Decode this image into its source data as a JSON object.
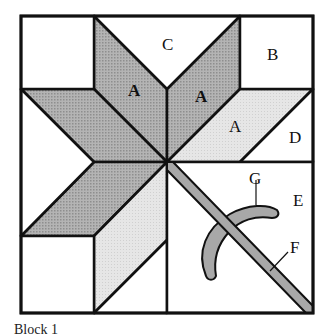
{
  "diagram": {
    "colors": {
      "outline": "#111111",
      "dark_fill": "#a6a6a6",
      "light_fill": "#e2e2e2",
      "applique_fill": "#a8a8a8",
      "background": "#ffffff"
    },
    "labels": {
      "A_top_left": "A",
      "A_top_right": "A",
      "A_right": "A",
      "B": "B",
      "C": "C",
      "D": "D",
      "E": "E",
      "F": "F",
      "G": "G"
    }
  },
  "caption": {
    "text": "Block 1"
  }
}
